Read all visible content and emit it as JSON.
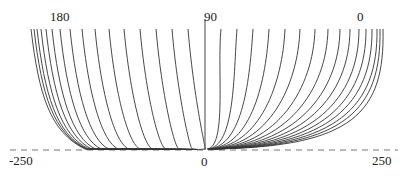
{
  "labels": {
    "top_left": "180",
    "top_center": "90",
    "top_right": "0",
    "bottom_left": "-250",
    "bottom_center": "0",
    "bottom_right": "250"
  },
  "style": {
    "curve_color": "#333333",
    "axis_color": "#444444",
    "baseline_color": "#777777"
  },
  "geometry": {
    "top_y": 29,
    "baseline_y": 150,
    "center_x": 205,
    "left_top_x": [
      31,
      34,
      37,
      41,
      46,
      52,
      60,
      70,
      82,
      95,
      109,
      124,
      140,
      156,
      172,
      188
    ],
    "right_top_x": [
      221,
      237,
      253,
      269,
      285,
      300,
      315,
      328,
      340,
      350,
      359,
      366,
      372,
      377,
      380,
      383
    ]
  }
}
